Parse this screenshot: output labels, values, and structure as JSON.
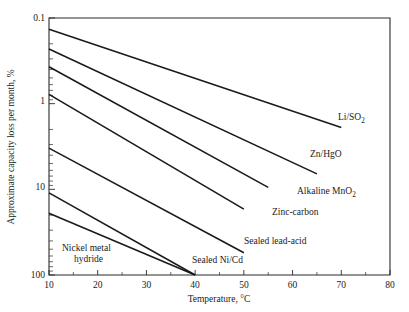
{
  "chart_data": {
    "type": "line",
    "title": "",
    "xlabel": "Temperature, °C",
    "ylabel": "Approximate capacity loss per month, %",
    "xlim": [
      10,
      80
    ],
    "ylim": [
      0.1,
      100
    ],
    "yscale": "log-inverted",
    "grid": false,
    "legend_position": "inline-end-labels",
    "xticks": [
      10,
      20,
      30,
      40,
      50,
      60,
      70,
      80
    ],
    "xticklabels": [
      "10",
      "20",
      "30",
      "40",
      "50",
      "60",
      "70",
      "80"
    ],
    "xminorticks": [
      15,
      25,
      35,
      45,
      55,
      65,
      75
    ],
    "yticks": [
      0.1,
      1,
      10,
      100
    ],
    "yticklabels": [
      "0.1",
      "1",
      "10",
      "100"
    ],
    "series": [
      {
        "name": "Li/SO2",
        "label_main": "Li/SO",
        "label_sub": "2",
        "x": [
          10,
          70
        ],
        "y": [
          0.135,
          1.9
        ],
        "label_x": 338,
        "label_y": 120
      },
      {
        "name": "Zn/HgO",
        "label_main": "Zn/HgO",
        "label_sub": "",
        "x": [
          10,
          65
        ],
        "y": [
          0.23,
          6.6
        ],
        "label_x": 310,
        "label_y": 157
      },
      {
        "name": "Alkaline MnO2",
        "label_main": "Alkaline MnO",
        "label_sub": "2",
        "x": [
          10,
          55
        ],
        "y": [
          0.37,
          9.5
        ],
        "label_x": 297,
        "label_y": 193
      },
      {
        "name": "Zinc-carbon",
        "label_main": "Zinc-carbon",
        "label_sub": "",
        "x": [
          10,
          50
        ],
        "y": [
          0.78,
          17.0
        ],
        "label_x": 272,
        "label_y": 214
      },
      {
        "name": "Sealed lead-acid",
        "label_main": "Sealed lead-acid",
        "label_sub": "",
        "x": [
          10,
          50
        ],
        "y": [
          3.3,
          55.0
        ],
        "label_x": 244,
        "label_y": 243
      },
      {
        "name": "Sealed Ni/Cd",
        "label_main": "Sealed Ni/Cd",
        "label_sub": "",
        "x": [
          10,
          40
        ],
        "y": [
          11.0,
          100.0
        ],
        "label_x": 193,
        "label_y": 262
      },
      {
        "name": "Nickel metal hydride",
        "label_main": "Nickel metal",
        "label_sub": "hydride",
        "x": [
          10,
          40
        ],
        "y": [
          19.0,
          100.0
        ],
        "label_x": 62,
        "label_y": 253
      }
    ]
  },
  "labels": {
    "y_axis_title": "Approximate capacity loss per month, %",
    "x_axis_title": "Temperature, °C",
    "nickel_line1": "Nickel metal",
    "nickel_line2": "hydride",
    "sealed_nicd": "Sealed Ni/Cd",
    "sealed_lead_acid": "Sealed lead-acid",
    "zinc_carbon": "Zinc-carbon",
    "alkaline_mno2_main": "Alkaline MnO",
    "alkaline_mno2_sub": "2",
    "zn_hgo": "Zn/HgO",
    "li_so2_main": "Li/SO",
    "li_so2_sub": "2",
    "ytick_0": "0.1",
    "ytick_1": "1",
    "ytick_2": "10",
    "ytick_3": "100",
    "xtick_0": "10",
    "xtick_1": "20",
    "xtick_2": "30",
    "xtick_3": "40",
    "xtick_4": "50",
    "xtick_5": "60",
    "xtick_6": "70",
    "xtick_7": "80"
  },
  "colors": {
    "axis": "#2b2b2b",
    "curve": "#1a1a1a",
    "background": "#ffffff"
  }
}
